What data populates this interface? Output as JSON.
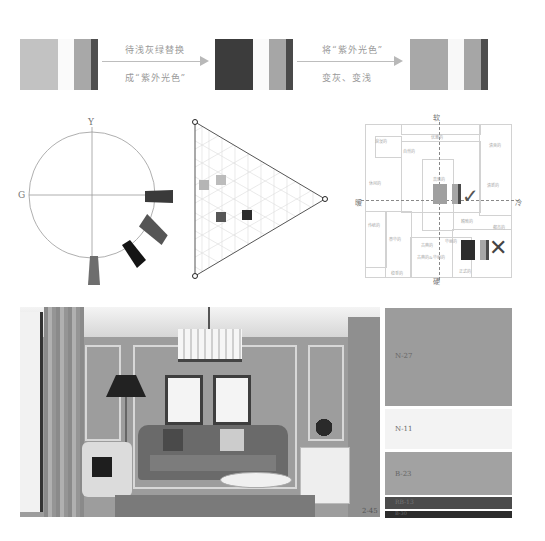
{
  "top_row": {
    "groups": [
      {
        "id": "original",
        "colors": [
          "#c2c2c2",
          "#fafafa",
          "#a8a8a8",
          "#4f4f4f"
        ]
      },
      {
        "id": "replaced",
        "colors": [
          "#3c3c3c",
          "#fafafa",
          "#a6a6a6",
          "#4a4a4a"
        ]
      },
      {
        "id": "adjusted",
        "colors": [
          "#a8a8a8",
          "#f8f8f8",
          "#a6a6a6",
          "#4e4e4e"
        ]
      }
    ],
    "arrow1": {
      "top_text": "待浅灰绿替换",
      "bottom_text": "成“紫外光色”"
    },
    "arrow2": {
      "top_text": "将“紫外光色”",
      "bottom_text": "变灰、变浅"
    }
  },
  "hue_circle": {
    "axis_top": "Y",
    "axis_left": "G",
    "markers": [
      {
        "angle": 0,
        "color": "#3a3a3a"
      },
      {
        "angle": -35,
        "color": "#555555"
      },
      {
        "angle": -58,
        "color": "#141414"
      },
      {
        "angle": -90,
        "color": "#6e6e6e"
      }
    ]
  },
  "tone_triangle": {
    "squares": [
      {
        "x": 18,
        "y": 72,
        "color": "#b5b5b5"
      },
      {
        "x": 36,
        "y": 66,
        "color": "#bcbcbc"
      },
      {
        "x": 36,
        "y": 102,
        "color": "#575757"
      },
      {
        "x": 62,
        "y": 100,
        "color": "#2d2d2d"
      }
    ]
  },
  "image_scale": {
    "axis_top": "软",
    "axis_bottom": "硬",
    "axis_left": "暖",
    "axis_right": "冷",
    "regions": [
      {
        "label": "浪漫的",
        "x": 20,
        "y": 26
      },
      {
        "label": "自然的",
        "x": 60,
        "y": 35
      },
      {
        "label": "优雅的",
        "x": 76,
        "y": 20
      },
      {
        "label": "清爽的",
        "x": 134,
        "y": 20
      },
      {
        "label": "休闲的",
        "x": 12,
        "y": 68
      },
      {
        "label": "高雅的",
        "x": 73,
        "y": 63
      },
      {
        "label": "清新的",
        "x": 128,
        "y": 70
      },
      {
        "label": "传统的",
        "x": 12,
        "y": 110
      },
      {
        "label": "精致的",
        "x": 102,
        "y": 107
      },
      {
        "label": "都市的",
        "x": 137,
        "y": 110
      },
      {
        "label": "豪华的",
        "x": 32,
        "y": 125
      },
      {
        "label": "古典的",
        "x": 65,
        "y": 130
      },
      {
        "label": "华丽的",
        "x": 88,
        "y": 126
      },
      {
        "label": "古典的&华丽的",
        "x": 62,
        "y": 144
      },
      {
        "label": "稳重的",
        "x": 32,
        "y": 155
      },
      {
        "label": "正式的",
        "x": 103,
        "y": 155
      }
    ],
    "good_mark": "✓",
    "bad_mark": "✕"
  },
  "room_image": {
    "figure_label": "2-45"
  },
  "palette": [
    {
      "code": "N-27",
      "color": "#9c9c9c",
      "height": 104
    },
    {
      "code": "N-11",
      "color": "#f3f3f3",
      "height": 42
    },
    {
      "code": "B-23",
      "color": "#a2a2a2",
      "height": 44
    },
    {
      "code": "RB-13",
      "color": "#4b4b4b",
      "height": 12
    },
    {
      "code": "B-30",
      "color": "#2c2c2c",
      "height": 8
    }
  ]
}
